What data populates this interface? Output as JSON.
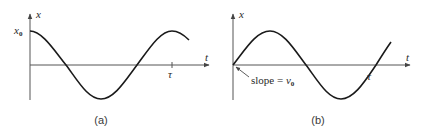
{
  "panels": [
    {
      "id": "a",
      "caption": "(a)",
      "y_axis_label": "x",
      "x_axis_label": "t",
      "initial_value_label": "x",
      "initial_value_subscript": "0",
      "period_label": "τ",
      "curve": "cosine",
      "description": "x(t) = x0 cos(2πt/τ)"
    },
    {
      "id": "b",
      "caption": "(b)",
      "y_axis_label": "x",
      "x_axis_label": "t",
      "slope_label_prefix": "slope = ",
      "slope_label_var": "v",
      "slope_label_subscript": "0",
      "period_label": "τ",
      "curve": "sine",
      "description": "x(t) = (v0 τ / 2π) sin(2πt/τ)"
    }
  ],
  "colors": {
    "curve": "#1a1a1a",
    "axis": "#555555",
    "text": "#2a2a2a",
    "background": "#ffffff"
  }
}
